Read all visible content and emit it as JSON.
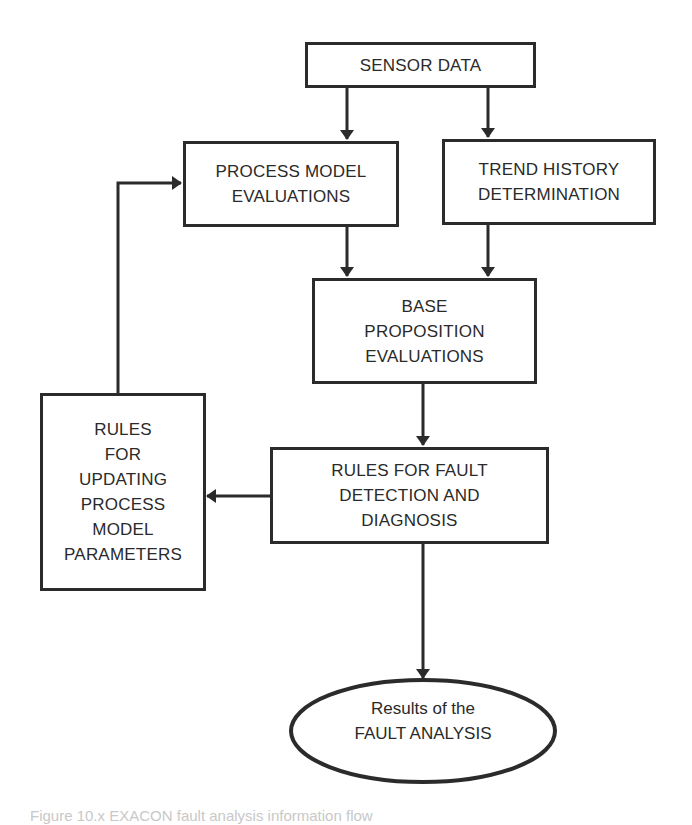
{
  "diagram": {
    "type": "flowchart",
    "colors": {
      "stroke": "#2b2b2b",
      "text": "#2a2a2a",
      "background": "#ffffff"
    },
    "nodes": [
      {
        "id": "sensor_data",
        "shape": "rect",
        "label": "SENSOR DATA"
      },
      {
        "id": "process_model_evaluations",
        "shape": "rect",
        "label": "PROCESS MODEL\nEVALUATIONS"
      },
      {
        "id": "trend_history_determination",
        "shape": "rect",
        "label": "TREND HISTORY\nDETERMINATION"
      },
      {
        "id": "base_proposition_evaluations",
        "shape": "rect",
        "label": "BASE\nPROPOSITION\nEVALUATIONS"
      },
      {
        "id": "rules_fault_detection",
        "shape": "rect",
        "label": "RULES FOR FAULT\nDETECTION AND\nDIAGNOSIS"
      },
      {
        "id": "rules_updating_parameters",
        "shape": "rect",
        "label": "RULES\nFOR\nUPDATING\nPROCESS\nMODEL\nPARAMETERS"
      },
      {
        "id": "results_fault_analysis",
        "shape": "ellipse",
        "label": "Results of the\nFAULT ANALYSIS"
      }
    ],
    "edges": [
      {
        "from": "sensor_data",
        "to": "process_model_evaluations"
      },
      {
        "from": "sensor_data",
        "to": "trend_history_determination"
      },
      {
        "from": "process_model_evaluations",
        "to": "base_proposition_evaluations"
      },
      {
        "from": "trend_history_determination",
        "to": "base_proposition_evaluations"
      },
      {
        "from": "base_proposition_evaluations",
        "to": "rules_fault_detection"
      },
      {
        "from": "rules_fault_detection",
        "to": "rules_updating_parameters"
      },
      {
        "from": "rules_updating_parameters",
        "to": "process_model_evaluations"
      },
      {
        "from": "rules_fault_detection",
        "to": "results_fault_analysis"
      }
    ]
  },
  "caption": {
    "text": "Figure 10.x   EXACON fault analysis information flow"
  }
}
